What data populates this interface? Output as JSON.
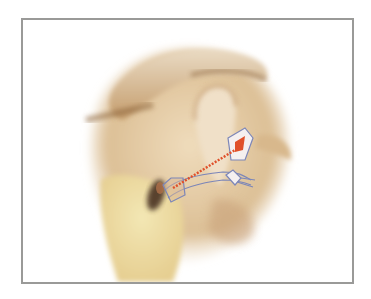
{
  "figure": {
    "frame_color": "#9a9a98",
    "background_color": "#ffffff",
    "colors": {
      "skin_light": "#f1e2c8",
      "skin_mid": "#d9b88a",
      "skin_shadow": "#9c7448",
      "bone_yellow": "#ecdca0",
      "canal_dark": "#4a3324",
      "device_outline": "#7c86b8",
      "device_accent": "#e0502a"
    }
  }
}
